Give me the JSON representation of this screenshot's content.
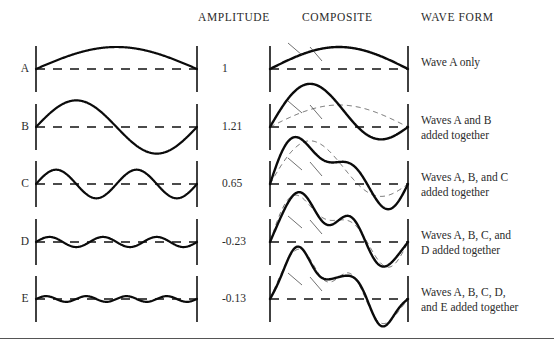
{
  "figure": {
    "title_headers": {
      "amplitude": "AMPLITUDE",
      "composite": "COMPOSITE",
      "waveform": "WAVE FORM"
    },
    "rows": [
      {
        "label": "A",
        "amplitude": "1",
        "description": "Wave A only",
        "cycles": 0.5,
        "component_amplitude": 1.0
      },
      {
        "label": "B",
        "amplitude": "1.21",
        "description": "Waves A and B\nadded together",
        "cycles": 1,
        "component_amplitude": 1.21
      },
      {
        "label": "C",
        "amplitude": "0.65",
        "description": "Waves A, B, and C\nadded together",
        "cycles": 2,
        "component_amplitude": 0.65
      },
      {
        "label": "D",
        "amplitude": "-0.23",
        "description": "Waves A, B, C, and\nD added together",
        "cycles": 3,
        "component_amplitude": -0.23
      },
      {
        "label": "E",
        "amplitude": "-0.13",
        "description": "Waves A, B, C, D,\nand E added together",
        "cycles": 4,
        "component_amplitude": -0.13
      }
    ]
  },
  "chart_data": {
    "type": "line",
    "title": "",
    "xlabel": "",
    "ylabel": "",
    "grid": false,
    "legend": "none",
    "series": [
      {
        "name": "A",
        "kind": "component",
        "harmonic": 1,
        "half_cycles": 1,
        "amplitude": 1
      },
      {
        "name": "B",
        "kind": "component",
        "harmonic": 2,
        "half_cycles": 2,
        "amplitude": 1.21
      },
      {
        "name": "C",
        "kind": "component",
        "harmonic": 4,
        "half_cycles": 4,
        "amplitude": 0.65
      },
      {
        "name": "D",
        "kind": "component",
        "harmonic": 6,
        "half_cycles": 6,
        "amplitude": -0.23
      },
      {
        "name": "E",
        "kind": "component",
        "harmonic": 8,
        "half_cycles": 8,
        "amplitude": -0.13
      }
    ],
    "composites": [
      {
        "name": "A",
        "includes": [
          "A"
        ]
      },
      {
        "name": "A+B",
        "includes": [
          "A",
          "B"
        ]
      },
      {
        "name": "A+B+C",
        "includes": [
          "A",
          "B",
          "C"
        ]
      },
      {
        "name": "A+B+C+D",
        "includes": [
          "A",
          "B",
          "C",
          "D"
        ]
      },
      {
        "name": "A+B+C+D+E",
        "includes": [
          "A",
          "B",
          "C",
          "D",
          "E"
        ]
      }
    ],
    "amplitudes_listed": [
      1,
      1.21,
      0.65,
      -0.23,
      -0.13
    ]
  }
}
